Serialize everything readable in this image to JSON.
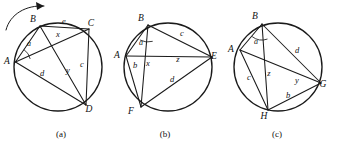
{
  "page": {
    "background_color": "#ffffff",
    "ink_color": "#1a1a1a",
    "width": 338,
    "height": 148
  },
  "figures": [
    {
      "id": "figure-a",
      "caption": "(a)",
      "caption_x": 61,
      "caption_y": 137,
      "circle": {
        "cx": 58,
        "cy": 67,
        "r": 44
      },
      "vertices": [
        {
          "name": "A",
          "label": "A",
          "x": 15.5,
          "y": 62,
          "lx": 7,
          "ly": 64
        },
        {
          "name": "B",
          "label": "B",
          "x": 40,
          "y": 26,
          "lx": 33,
          "ly": 22
        },
        {
          "name": "C",
          "label": "C",
          "x": 89,
          "y": 29,
          "lx": 91,
          "ly": 26
        },
        {
          "name": "D",
          "label": "D",
          "x": 86,
          "y": 105,
          "lx": 89,
          "ly": 112
        }
      ],
      "chords": [
        {
          "name": "chord-AB",
          "from": "A",
          "to": "B"
        },
        {
          "name": "chord-BC",
          "from": "B",
          "to": "C"
        },
        {
          "name": "chord-CD",
          "from": "C",
          "to": "D"
        },
        {
          "name": "chord-AD",
          "from": "A",
          "to": "D"
        },
        {
          "name": "chord-AC",
          "from": "A",
          "to": "C"
        },
        {
          "name": "chord-BD",
          "from": "B",
          "to": "D"
        }
      ],
      "segment_labels": [
        {
          "name": "label-e",
          "text": "e",
          "x": 64,
          "y": 24
        },
        {
          "name": "label-x",
          "text": "x",
          "x": 58,
          "y": 37
        },
        {
          "name": "label-c",
          "text": "c",
          "x": 82,
          "y": 67
        },
        {
          "name": "label-y",
          "text": "y",
          "x": 68,
          "y": 73
        },
        {
          "name": "label-d",
          "text": "d",
          "x": 42,
          "y": 76
        }
      ],
      "angle_labels": [
        {
          "name": "angle-a",
          "text": "a",
          "x": 29,
          "y": 46
        }
      ],
      "angle_arcs": [
        {
          "name": "angle-arc-a",
          "cx": 15.5,
          "cy": 62,
          "r": 15,
          "a1": -56,
          "a2": -12
        }
      ],
      "rotation_arrow": {
        "name": "rotation-arrow",
        "path": "M 6,30 C 10,14 26,5 44,6",
        "head": "44,6 36,2 37,10"
      }
    },
    {
      "id": "figure-b",
      "caption": "(b)",
      "caption_x": 165,
      "caption_y": 137,
      "circle": {
        "cx": 168,
        "cy": 67,
        "r": 44
      },
      "vertices": [
        {
          "name": "A",
          "label": "A",
          "x": 126,
          "y": 56,
          "lx": 117,
          "ly": 58
        },
        {
          "name": "B",
          "label": "B",
          "x": 148,
          "y": 25,
          "lx": 141,
          "ly": 21
        },
        {
          "name": "E",
          "label": "E",
          "x": 212,
          "y": 57,
          "lx": 214,
          "ly": 59
        },
        {
          "name": "F",
          "label": "F",
          "x": 141,
          "y": 107,
          "lx": 131,
          "ly": 114
        }
      ],
      "chords": [
        {
          "name": "chord-AB",
          "from": "A",
          "to": "B"
        },
        {
          "name": "chord-BE",
          "from": "B",
          "to": "E"
        },
        {
          "name": "chord-EF",
          "from": "E",
          "to": "F"
        },
        {
          "name": "chord-AF",
          "from": "A",
          "to": "F"
        },
        {
          "name": "chord-AE",
          "from": "A",
          "to": "E"
        },
        {
          "name": "chord-BF",
          "from": "B",
          "to": "F"
        }
      ],
      "segment_labels": [
        {
          "name": "label-c",
          "text": "c",
          "x": 182,
          "y": 36
        },
        {
          "name": "label-z",
          "text": "z",
          "x": 178,
          "y": 62
        },
        {
          "name": "label-x",
          "text": "x",
          "x": 148,
          "y": 66
        },
        {
          "name": "label-b",
          "text": "b",
          "x": 135,
          "y": 68
        },
        {
          "name": "label-d",
          "text": "d",
          "x": 172,
          "y": 82
        }
      ],
      "angle_labels": [
        {
          "name": "angle-a",
          "text": "a",
          "x": 141,
          "y": 45
        }
      ],
      "angle_arcs": [
        {
          "name": "angle-arc-a",
          "cx": 148,
          "cy": 25,
          "r": 17,
          "a1": 74,
          "a2": 118
        }
      ]
    },
    {
      "id": "figure-c",
      "caption": "(c)",
      "caption_x": 277,
      "caption_y": 137,
      "circle": {
        "cx": 278,
        "cy": 67,
        "r": 44
      },
      "vertices": [
        {
          "name": "A",
          "label": "A",
          "x": 240,
          "y": 50,
          "lx": 231,
          "ly": 52
        },
        {
          "name": "B",
          "label": "B",
          "x": 262,
          "y": 24,
          "lx": 255,
          "ly": 19
        },
        {
          "name": "G",
          "label": "G",
          "x": 321,
          "y": 83,
          "lx": 323,
          "ly": 87
        },
        {
          "name": "H",
          "label": "H",
          "x": 268,
          "y": 110,
          "lx": 264,
          "ly": 119
        }
      ],
      "chords": [
        {
          "name": "chord-AB",
          "from": "A",
          "to": "B"
        },
        {
          "name": "chord-BG",
          "from": "B",
          "to": "G"
        },
        {
          "name": "chord-GH",
          "from": "G",
          "to": "H"
        },
        {
          "name": "chord-AH",
          "from": "A",
          "to": "H"
        },
        {
          "name": "chord-AG",
          "from": "A",
          "to": "G"
        },
        {
          "name": "chord-BH",
          "from": "B",
          "to": "H"
        }
      ],
      "segment_labels": [
        {
          "name": "label-d",
          "text": "d",
          "x": 297,
          "y": 53
        },
        {
          "name": "label-c",
          "text": "c",
          "x": 249,
          "y": 80
        },
        {
          "name": "label-z",
          "text": "z",
          "x": 269,
          "y": 76
        },
        {
          "name": "label-y",
          "text": "y",
          "x": 297,
          "y": 83
        },
        {
          "name": "label-b",
          "text": "b",
          "x": 288,
          "y": 98
        }
      ],
      "angle_labels": [
        {
          "name": "angle-a",
          "text": "a",
          "x": 256,
          "y": 44
        }
      ],
      "angle_arcs": [
        {
          "name": "angle-arc-a",
          "cx": 262,
          "cy": 24,
          "r": 16,
          "a1": 70,
          "a2": 128
        }
      ]
    }
  ]
}
